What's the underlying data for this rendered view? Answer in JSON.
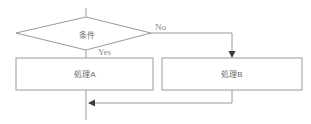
{
  "diagram": {
    "type": "flowchart",
    "nodes": {
      "condition": {
        "label": "条件",
        "shape": "diamond"
      },
      "process_a": {
        "label": "処理A",
        "shape": "rect"
      },
      "process_b": {
        "label": "処理B",
        "shape": "rect"
      }
    },
    "edges": {
      "yes_branch": {
        "label": "Yes",
        "from": "condition",
        "to": "process_a"
      },
      "no_branch": {
        "label": "No",
        "from": "condition",
        "to": "process_b"
      },
      "merge": {
        "label": "",
        "from": "process_b",
        "to": "flow-line-below-process_a"
      }
    },
    "colors": {
      "background": "#ffffff",
      "line": "#9a9a9a",
      "arrowhead": "#3c3c3c",
      "node_fill": "#ffffff",
      "node_label_text": "#6b6b6b",
      "edge_label_text": "#8a8a8a"
    }
  }
}
